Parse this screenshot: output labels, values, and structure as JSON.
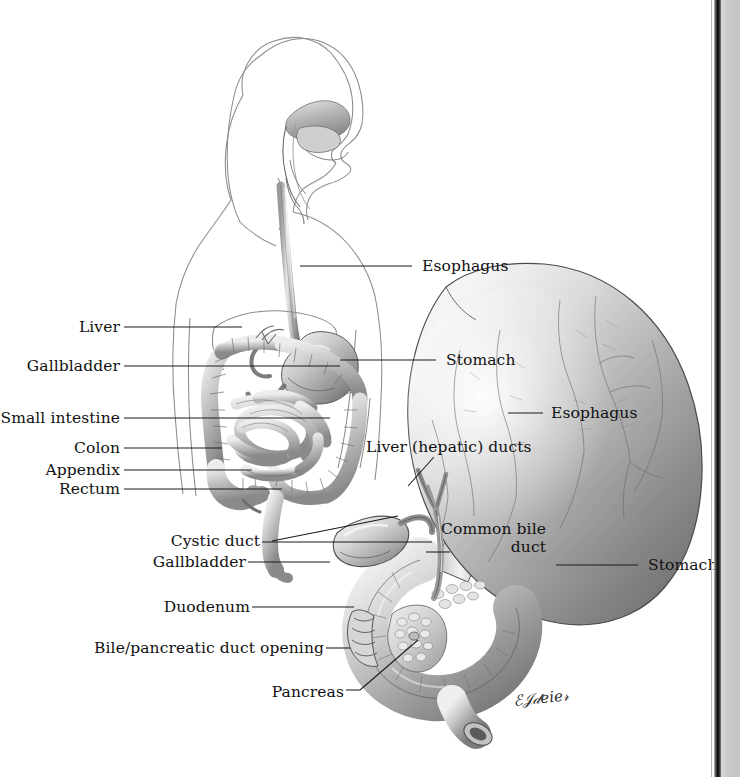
{
  "plate": {
    "title": "Digestive system anatomy plate",
    "background": "#ffffff",
    "ink": "#111111",
    "leader_color": "#1a1a1a",
    "outline_color": "#8b8b8b",
    "gutter_color": "#c4c4c4",
    "signature": "EJDeier"
  },
  "overview_figure": {
    "name": "whole-body-digestive-tract",
    "labels_left": [
      {
        "key": "liver",
        "text": "Liver"
      },
      {
        "key": "gallbladder",
        "text": "Gallbladder"
      },
      {
        "key": "small-intestine",
        "text": "Small intestine"
      },
      {
        "key": "colon",
        "text": "Colon"
      },
      {
        "key": "appendix",
        "text": "Appendix"
      },
      {
        "key": "rectum",
        "text": "Rectum"
      }
    ],
    "labels_right": [
      {
        "key": "esophagus",
        "text": "Esophagus"
      },
      {
        "key": "stomach",
        "text": "Stomach"
      }
    ]
  },
  "detail_figure": {
    "name": "stomach-duodenum-biliary-detail",
    "labels_left": [
      {
        "key": "liver-hepatic-ducts",
        "text": "Liver (hepatic) ducts"
      },
      {
        "key": "cystic-duct",
        "text": "Cystic duct"
      },
      {
        "key": "gallbladder",
        "text": "Gallbladder"
      },
      {
        "key": "duodenum",
        "text": "Duodenum"
      },
      {
        "key": "bile-pancreatic-opening",
        "text": "Bile/pancreatic duct opening"
      },
      {
        "key": "pancreas",
        "text": "Pancreas"
      }
    ],
    "labels_right": [
      {
        "key": "esophagus",
        "text": "Esophagus"
      },
      {
        "key": "stomach",
        "text": "Stomach"
      }
    ],
    "common_bile_duct": {
      "line1": "Common bile",
      "line2": "duct"
    }
  }
}
